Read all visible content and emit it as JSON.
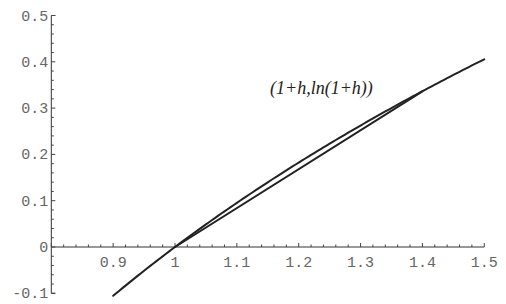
{
  "chart_data": {
    "type": "line",
    "title": "",
    "xlabel": "",
    "ylabel": "",
    "xlim": [
      0.8,
      1.5
    ],
    "ylim": [
      -0.1,
      0.5
    ],
    "grid": false,
    "x_ticks": [
      "0.9",
      "1",
      "1.1",
      "1.2",
      "1.3",
      "1.4",
      "1.5"
    ],
    "x_tick_values": [
      0.9,
      1.0,
      1.1,
      1.2,
      1.3,
      1.4,
      1.5
    ],
    "y_ticks": [
      "-0.1",
      "0",
      "0.1",
      "0.2",
      "0.3",
      "0.4",
      "0.5"
    ],
    "y_tick_values": [
      -0.1,
      0,
      0.1,
      0.2,
      0.3,
      0.4,
      0.5
    ],
    "minor_tick_step": 0.02,
    "series": [
      {
        "name": "ln(x)",
        "function": "ln(x)",
        "x": [
          0.9,
          0.95,
          1.0,
          1.05,
          1.1,
          1.15,
          1.2,
          1.25,
          1.3,
          1.35,
          1.4,
          1.45,
          1.5
        ],
        "values": [
          -0.105,
          -0.051,
          0.0,
          0.049,
          0.095,
          0.14,
          0.182,
          0.223,
          0.262,
          0.3,
          0.336,
          0.372,
          0.405
        ]
      },
      {
        "name": "secant line",
        "x": [
          1.0,
          1.4
        ],
        "values": [
          0.0,
          0.336
        ]
      }
    ],
    "annotations": [
      {
        "text": "(1+h,ln(1+h))",
        "x": 1.155,
        "y": 0.33
      }
    ]
  }
}
